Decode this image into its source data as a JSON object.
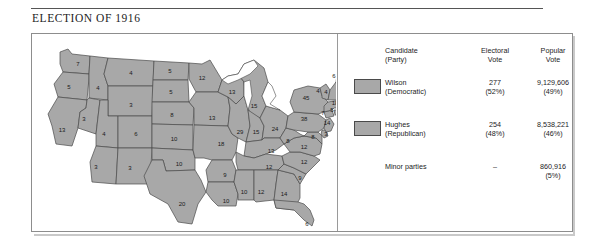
{
  "figure": {
    "title": "ELECTION OF 1916",
    "year_label": "1916"
  },
  "colors": {
    "state_fill": "#a8a8a8",
    "state_stroke": "#4a4a4a",
    "water": "#ffffff",
    "panel_border": "#8d8d8d",
    "text": "#1d1d1d"
  },
  "legend": {
    "headers": {
      "candidate": "Candidate\n(Party)",
      "candidate_line1": "Candidate",
      "candidate_line2": "(Party)",
      "electoral_line1": "Electoral",
      "electoral_line2": "Vote",
      "popular_line1": "Popular",
      "popular_line2": "Vote"
    },
    "rows": [
      {
        "swatch": "#a8a8a8",
        "has_swatch": true,
        "name_line1": "Wilson",
        "name_line2": "(Democratic)",
        "electoral_line1": "277",
        "electoral_line2": "(52%)",
        "popular_line1": "9,129,606",
        "popular_line2": "(49%)"
      },
      {
        "swatch": "#a8a8a8",
        "has_swatch": true,
        "name_line1": "Hughes",
        "name_line2": "(Republican)",
        "electoral_line1": "254",
        "electoral_line2": "(48%)",
        "popular_line1": "8,538,221",
        "popular_line2": "(46%)"
      },
      {
        "swatch": "",
        "has_swatch": false,
        "name_line1": "Minor parties",
        "name_line2": "",
        "electoral_line1": "–",
        "electoral_line2": "",
        "popular_line1": "860,916",
        "popular_line2": "(5%)"
      }
    ]
  },
  "chart_data": {
    "type": "map",
    "title": "ELECTION OF 1916",
    "subtitle": "1916",
    "unit": "electoral votes",
    "states": [
      {
        "code": "WA",
        "value": 7,
        "x": 46,
        "y": 30
      },
      {
        "code": "OR",
        "value": 5,
        "x": 37,
        "y": 53
      },
      {
        "code": "CA",
        "value": 13,
        "x": 30,
        "y": 96
      },
      {
        "code": "ID",
        "value": 4,
        "x": 66,
        "y": 54
      },
      {
        "code": "NV",
        "value": 3,
        "x": 52,
        "y": 85
      },
      {
        "code": "MT",
        "value": 4,
        "x": 99,
        "y": 39
      },
      {
        "code": "WY",
        "value": 3,
        "x": 99,
        "y": 71
      },
      {
        "code": "UT",
        "value": 4,
        "x": 72,
        "y": 100
      },
      {
        "code": "AZ",
        "value": 3,
        "x": 64,
        "y": 133
      },
      {
        "code": "CO",
        "value": 6,
        "x": 104,
        "y": 100
      },
      {
        "code": "NM",
        "value": 3,
        "x": 98,
        "y": 134
      },
      {
        "code": "ND",
        "value": 5,
        "x": 138,
        "y": 37
      },
      {
        "code": "SD",
        "value": 5,
        "x": 139,
        "y": 58
      },
      {
        "code": "NE",
        "value": 8,
        "x": 140,
        "y": 81
      },
      {
        "code": "KS",
        "value": 10,
        "x": 142,
        "y": 105
      },
      {
        "code": "OK",
        "value": 10,
        "x": 147,
        "y": 130
      },
      {
        "code": "TX",
        "value": 20,
        "x": 150,
        "y": 170
      },
      {
        "code": "MN",
        "value": 12,
        "x": 170,
        "y": 44
      },
      {
        "code": "IA",
        "value": 13,
        "x": 180,
        "y": 84
      },
      {
        "code": "MO",
        "value": 18,
        "x": 189,
        "y": 110
      },
      {
        "code": "AR",
        "value": 9,
        "x": 193,
        "y": 141
      },
      {
        "code": "LA",
        "value": 10,
        "x": 194,
        "y": 167
      },
      {
        "code": "WI",
        "value": 13,
        "x": 200,
        "y": 58
      },
      {
        "code": "IL",
        "value": 29,
        "x": 208,
        "y": 98
      },
      {
        "code": "MI",
        "value": 15,
        "x": 222,
        "y": 72
      },
      {
        "code": "IN",
        "value": 15,
        "x": 224,
        "y": 98
      },
      {
        "code": "OH",
        "value": 24,
        "x": 243,
        "y": 95
      },
      {
        "code": "KY",
        "value": 13,
        "x": 239,
        "y": 117
      },
      {
        "code": "TN",
        "value": 12,
        "x": 237,
        "y": 133
      },
      {
        "code": "MS",
        "value": 10,
        "x": 212,
        "y": 158
      },
      {
        "code": "AL",
        "value": 12,
        "x": 229,
        "y": 158
      },
      {
        "code": "GA",
        "value": 14,
        "x": 252,
        "y": 160
      },
      {
        "code": "FL",
        "value": 6,
        "x": 275,
        "y": 190
      },
      {
        "code": "SC",
        "value": 9,
        "x": 268,
        "y": 144
      },
      {
        "code": "NC",
        "value": 12,
        "x": 272,
        "y": 128
      },
      {
        "code": "VA",
        "value": 12,
        "x": 272,
        "y": 113
      },
      {
        "code": "WV",
        "value": 8,
        "x": 256,
        "y": 107
      },
      {
        "code": "MD",
        "value": 8,
        "x": 281,
        "y": 103
      },
      {
        "code": "DE",
        "value": 3,
        "x": 294,
        "y": 100
      },
      {
        "code": "PA",
        "value": 38,
        "x": 272,
        "y": 85
      },
      {
        "code": "NJ",
        "value": 14,
        "x": 295,
        "y": 89
      },
      {
        "code": "NY",
        "value": 45,
        "x": 274,
        "y": 64
      },
      {
        "code": "CT",
        "value": 7,
        "x": 291,
        "y": 79
      },
      {
        "code": "RI",
        "value": 5,
        "x": 300,
        "y": 76
      },
      {
        "code": "MA",
        "value": 18,
        "x": 303,
        "y": 69
      },
      {
        "code": "VT",
        "value": 4,
        "x": 286,
        "y": 57
      },
      {
        "code": "NH",
        "value": 4,
        "x": 294,
        "y": 58
      },
      {
        "code": "ME",
        "value": 6,
        "x": 302,
        "y": 42
      }
    ]
  }
}
